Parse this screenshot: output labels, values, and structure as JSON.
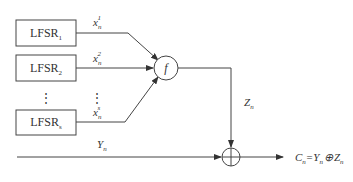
{
  "diagram": {
    "type": "nonlinear-combination-generator",
    "registers": [
      {
        "name": "LFSR",
        "subscript": "1",
        "output_var": "x",
        "output_sub": "n",
        "output_sup": "1"
      },
      {
        "name": "LFSR",
        "subscript": "2",
        "output_var": "x",
        "output_sub": "n",
        "output_sup": "2"
      },
      {
        "name": "LFSR",
        "subscript": "s",
        "output_var": "x",
        "output_sub": "n",
        "output_sup": "s"
      }
    ],
    "ellipsis": "⋮",
    "combiner": {
      "label": "f"
    },
    "keystream": {
      "var": "Z",
      "sub": "n"
    },
    "plaintext": {
      "var": "Y",
      "sub": "n"
    },
    "xor_symbol": "⊕",
    "output": {
      "var": "C",
      "sub": "n",
      "eq": "=",
      "y": "Y",
      "ysub": "n",
      "op": "⊕",
      "z": "Z",
      "zsub": "n"
    }
  }
}
